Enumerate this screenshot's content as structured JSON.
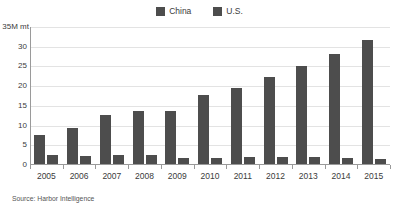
{
  "chart_data": {
    "type": "bar",
    "title": "",
    "subtitle": "",
    "xlabel": "",
    "ylabel": "35M mt",
    "unit_label": "35M mt",
    "ylim": [
      0,
      35
    ],
    "ytick_values": [
      35,
      30,
      25,
      20,
      15,
      10,
      5,
      0
    ],
    "ytick_labels": [
      "35M mt",
      "30",
      "25",
      "20",
      "15",
      "10",
      "5",
      "0"
    ],
    "grid": true,
    "legend_position": "top-center",
    "categories": [
      "2005",
      "2006",
      "2007",
      "2008",
      "2009",
      "2010",
      "2011",
      "2012",
      "2013",
      "2014",
      "2015"
    ],
    "series": [
      {
        "name": "China",
        "color": "#4d4d4d",
        "values": [
          7.4,
          9.1,
          12.5,
          13.5,
          13.5,
          17.4,
          19.4,
          22.0,
          24.8,
          28.0,
          31.4
        ]
      },
      {
        "name": "U.S.",
        "color": "#4d4d4d",
        "values": [
          2.3,
          2.1,
          2.3,
          2.4,
          1.5,
          1.5,
          1.7,
          1.8,
          1.7,
          1.5,
          1.3
        ]
      }
    ],
    "annotations": [
      "Source: Harbor Intelligence"
    ]
  },
  "legend": {
    "items": [
      {
        "label": "China",
        "swatch": "#4d4d4d"
      },
      {
        "label": "U.S.",
        "swatch": "#4d4d4d"
      }
    ]
  },
  "axes": {
    "y_labels": [
      "35M mt",
      "30",
      "25",
      "20",
      "15",
      "10",
      "5",
      "0"
    ],
    "x_labels": [
      "2005",
      "2006",
      "2007",
      "2008",
      "2009",
      "2010",
      "2011",
      "2012",
      "2013",
      "2014",
      "2015"
    ]
  },
  "footer": {
    "source": "Source: Harbor Intelligence"
  },
  "colors": {
    "bar": "#4d4d4d",
    "grid": "#e3e3e3",
    "axis": "#9a9a9a",
    "text": "#3b3b3b",
    "background": "#ffffff"
  }
}
